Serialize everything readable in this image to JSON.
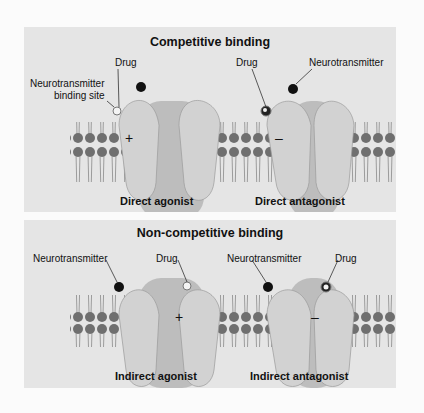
{
  "panels": [
    {
      "title": "Competitive binding",
      "labels": {
        "drug_left": "Drug",
        "binding_site_line1": "Neurotransmitter",
        "binding_site_line2": "binding site",
        "drug_right": "Drug",
        "neurotransmitter_right": "Neurotransmitter"
      },
      "captions": [
        "Direct agonist",
        "Direct antagonist"
      ],
      "signs": [
        "+",
        "–"
      ]
    },
    {
      "title": "Non-competitive binding",
      "labels": {
        "neurotransmitter_left": "Neurotransmitter",
        "drug_left": "Drug",
        "neurotransmitter_right": "Neurotransmitter",
        "drug_right": "Drug"
      },
      "captions": [
        "Indirect agonist",
        "Indirect antagonist"
      ],
      "signs": [
        "+",
        "–"
      ]
    }
  ],
  "colors": {
    "background": "#fbfbfb",
    "panel": "#e5e5e5",
    "receptor": "#cfcfcf",
    "receptor_dark": "#b0b0b0",
    "lipid_head": "#6f6f6f",
    "neurotransmitter": "#111111",
    "drug_agonist": "#f4f4f4"
  }
}
